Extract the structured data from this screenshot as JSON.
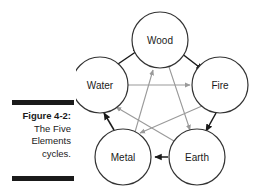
{
  "figure": {
    "caption_lines": [
      "Figure 4-2:",
      "The Five",
      "Elements",
      "cycles."
    ],
    "caption_label": "Figure 4-2:",
    "caption_body": "The Five Elements cycles.",
    "rule_color": "#1a1a1a"
  },
  "diagram": {
    "title": "The Five Elements cycles",
    "node_stroke": "#333333",
    "node_fill": "#ffffff",
    "generating_arrow_color": "#1a1a1a",
    "controlling_arrow_color": "#9a9a9a",
    "nodes": [
      {
        "id": "wood",
        "label": "Wood",
        "cx": 84,
        "cy": 40,
        "r": 28
      },
      {
        "id": "water",
        "label": "Water",
        "cx": 24,
        "cy": 85,
        "r": 28
      },
      {
        "id": "fire",
        "label": "Fire",
        "cx": 144,
        "cy": 85,
        "r": 28
      },
      {
        "id": "metal",
        "label": "Metal",
        "cx": 47,
        "cy": 157,
        "r": 28
      },
      {
        "id": "earth",
        "label": "Earth",
        "cx": 121,
        "cy": 157,
        "r": 28
      }
    ],
    "generating_cycle": [
      {
        "from": "water",
        "to": "wood"
      },
      {
        "from": "wood",
        "to": "fire"
      },
      {
        "from": "fire",
        "to": "earth"
      },
      {
        "from": "earth",
        "to": "metal"
      },
      {
        "from": "metal",
        "to": "water"
      }
    ],
    "controlling_cycle": [
      {
        "from": "water",
        "to": "fire"
      },
      {
        "from": "fire",
        "to": "metal"
      },
      {
        "from": "metal",
        "to": "wood"
      },
      {
        "from": "wood",
        "to": "earth"
      },
      {
        "from": "earth",
        "to": "water"
      }
    ]
  }
}
